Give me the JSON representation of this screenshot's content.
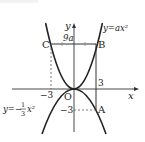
{
  "figure": {
    "type": "coordinate-plane diagram",
    "axes": {
      "x_label": "x",
      "y_label": "y",
      "origin_label": "O"
    },
    "curves": [
      {
        "name": "upper-parabola",
        "label": "y=ax²",
        "equation": "y = a x^2"
      },
      {
        "name": "lower-parabola",
        "label_prefix": "y=−",
        "label_num": "1",
        "label_den": "3",
        "label_suffix": "x²",
        "equation": "y = -(1/3) x^2"
      }
    ],
    "points": {
      "A": {
        "label": "A",
        "x": 3,
        "y": -3
      },
      "B": {
        "label": "B",
        "x": 3,
        "y": "9a"
      },
      "C": {
        "label": "C",
        "x": -3,
        "y": "9a"
      }
    },
    "tick_labels": {
      "x_neg3": "−3",
      "x_pos3": "3",
      "y_neg3": "−3",
      "y_9a": "9a"
    }
  }
}
